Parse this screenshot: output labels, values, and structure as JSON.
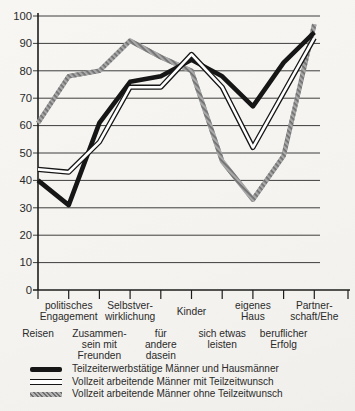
{
  "chart_data": {
    "type": "line",
    "title": "",
    "xlabel": "",
    "ylabel": "",
    "ylim": [
      0,
      100
    ],
    "ytick_step": 10,
    "yticks": [
      0,
      10,
      20,
      30,
      40,
      50,
      60,
      70,
      80,
      90,
      100
    ],
    "grid": "horizontal",
    "legend_position": "bottom",
    "categories": [
      "Reisen",
      "politisches Engagement",
      "Zusammensein mit Freunden",
      "Selbstverwirklichung",
      "für andere dasein",
      "Kinder",
      "sich etwas leisten",
      "eigenes Haus",
      "beruflicher Erfolg",
      "Partnerschaft/Ehe"
    ],
    "category_label_lines": [
      [
        "Reisen"
      ],
      [
        "politisches",
        "Engagement"
      ],
      [
        "Zusammen-",
        "sein mit",
        "Freunden"
      ],
      [
        "Selbstver-",
        "wirklichung"
      ],
      [
        "für",
        "andere",
        "dasein"
      ],
      [
        "Kinder"
      ],
      [
        "sich etwas",
        "leisten"
      ],
      [
        "eigenes",
        "Haus"
      ],
      [
        "beruflicher",
        "Erfolg"
      ],
      [
        "Partner-",
        "schaft/Ehe"
      ]
    ],
    "category_label_tier": [
      "lower",
      "upper",
      "lower",
      "upper",
      "lower",
      "upper",
      "lower",
      "upper",
      "lower",
      "upper"
    ],
    "series": [
      {
        "name": "Teilzeiterwerbstätige Männer und Hausmänner",
        "style": "thick-black-solid",
        "values": [
          40,
          31,
          61,
          76,
          78,
          84,
          78,
          67,
          83,
          94
        ]
      },
      {
        "name": "Vollzeit arbeitende Männer mit Teilzeitwunsch",
        "style": "double-outline-white",
        "values": [
          44,
          43,
          54,
          74,
          74,
          86,
          74,
          52,
          72,
          92
        ]
      },
      {
        "name": "Vollzeit arbeitende Männer ohne Teilzeitwunsch",
        "style": "gray-hatched",
        "values": [
          61,
          78,
          80,
          91,
          85,
          80,
          47,
          33,
          49,
          97
        ]
      }
    ],
    "colors": {
      "line_black": "#161616",
      "line_double_core": "#ffffff",
      "line_gray": "#a9a9a9",
      "hatch_dark": "#6f6f6f",
      "grid": "#3d3d3d",
      "axis": "#1d1d1d",
      "text": "#2a2a2a",
      "paper": "#f5f4f1"
    }
  }
}
